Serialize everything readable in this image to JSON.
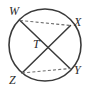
{
  "diagram": {
    "type": "circle-with-intersecting-chords",
    "background_color": "#ffffff",
    "stroke_color": "#3a3a3a",
    "dashed_stroke_color": "#6e6e6e",
    "label_color": "#2b2b2b",
    "circle": {
      "center_x": 45,
      "center_y": 45,
      "radius": 36
    },
    "points": [
      {
        "id": "W",
        "label": "W",
        "x": 20.0,
        "y": 20.5,
        "label_x": 9,
        "label_y": 15
      },
      {
        "id": "X",
        "label": "X",
        "x": 70.5,
        "y": 25.5,
        "label_x": 74,
        "label_y": 26
      },
      {
        "id": "Y",
        "label": "Y",
        "x": 70.0,
        "y": 68.5,
        "label_x": 74,
        "label_y": 74
      },
      {
        "id": "Z",
        "label": "Z",
        "x": 22.0,
        "y": 73.0,
        "label_x": 9,
        "label_y": 84
      },
      {
        "id": "T",
        "label": "T",
        "x": 45.5,
        "y": 45.5,
        "label_x": 33,
        "label_y": 48
      }
    ],
    "chords": [
      {
        "id": "WY",
        "from": "W",
        "to": "Y",
        "style": "solid"
      },
      {
        "id": "XZ",
        "from": "X",
        "to": "Z",
        "style": "solid"
      },
      {
        "id": "WX",
        "from": "W",
        "to": "X",
        "style": "dashed"
      },
      {
        "id": "ZY",
        "from": "Z",
        "to": "Y",
        "style": "dashed"
      }
    ],
    "intersection_point": "T"
  }
}
